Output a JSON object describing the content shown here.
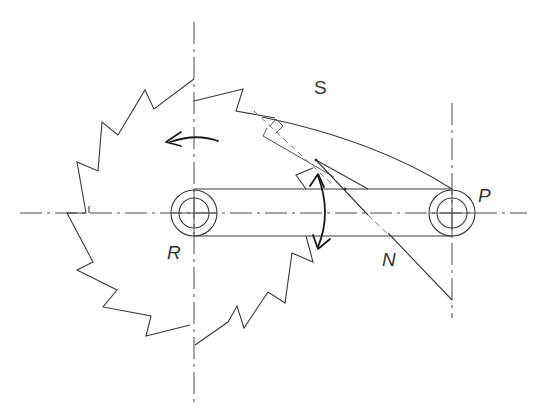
{
  "diagram": {
    "type": "ratchet-and-pawl mechanism",
    "labels": {
      "S": "S",
      "P": "P",
      "R": "R",
      "N": "N"
    },
    "components": [
      {
        "name": "ratchet-wheel",
        "center_label": "R",
        "rotation_direction": "counter-clockwise"
      },
      {
        "name": "pawl-link",
        "pivot_label": "P"
      },
      {
        "name": "pawl-arc",
        "label": "S"
      },
      {
        "name": "normal-line",
        "label": "N"
      },
      {
        "name": "oscillating-arm-arrow",
        "direction": "bidirectional"
      }
    ],
    "colors": {
      "line": "#3a3a3a",
      "background": "#ffffff"
    }
  }
}
